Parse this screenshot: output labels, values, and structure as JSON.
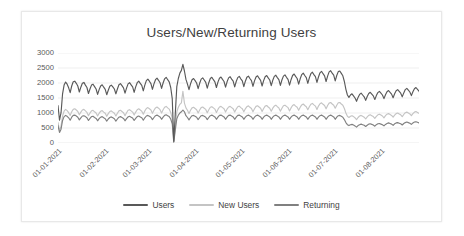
{
  "chart_data": {
    "type": "line",
    "title": "Users/New/Returning Users",
    "xlabel": "",
    "ylabel": "",
    "ylim": [
      0,
      3000
    ],
    "ytick_values": [
      0,
      500,
      1000,
      1500,
      2000,
      2500,
      3000
    ],
    "ytick_labels": [
      "0",
      "500",
      "1000",
      "1500",
      "2000",
      "2500",
      "3000"
    ],
    "grid": true,
    "grid_axis": "y",
    "legend_position": "bottom",
    "x_tick_labels": [
      "01-01-2021",
      "01-02-2021",
      "01-03-2021",
      "01-04-2021",
      "01-05-2021",
      "01-06-2021",
      "01-07-2021",
      "01-08-2021"
    ],
    "x_tick_positions": [
      0,
      31,
      59,
      90,
      120,
      151,
      181,
      212
    ],
    "x_range": [
      0,
      237
    ],
    "colors": {
      "users": "#595959",
      "new_users": "#c4c4c4",
      "returning": "#808080",
      "grid": "#e4e4e4",
      "text": "#595959",
      "title": "#3f3f3f",
      "background": "#ffffff",
      "frame_border": "#e8e8e8"
    },
    "series": [
      {
        "name": "Users",
        "color": "#595959",
        "values": [
          1250,
          760,
          1010,
          1640,
          1930,
          2030,
          1960,
          1840,
          1680,
          1900,
          2040,
          2060,
          1990,
          1900,
          1700,
          1860,
          1990,
          2020,
          1930,
          1850,
          1650,
          1800,
          1930,
          1960,
          1880,
          1800,
          1620,
          1780,
          1900,
          1940,
          1860,
          1790,
          1610,
          1760,
          1890,
          1930,
          1870,
          1800,
          1640,
          1800,
          1940,
          1980,
          1910,
          1840,
          1660,
          1830,
          1970,
          2010,
          1940,
          1870,
          1690,
          1870,
          2010,
          2060,
          1990,
          1920,
          1740,
          1930,
          2080,
          2130,
          2060,
          1980,
          1790,
          1970,
          2110,
          2160,
          2090,
          2010,
          1820,
          2000,
          2140,
          2190,
          2110,
          2040,
          1850,
          1480,
          60,
          980,
          1880,
          2150,
          2330,
          2420,
          2620,
          2400,
          2120,
          1960,
          1780,
          1970,
          2110,
          2150,
          2080,
          2000,
          1810,
          1990,
          2130,
          2170,
          2100,
          2020,
          1830,
          2010,
          2150,
          2190,
          2110,
          2040,
          1850,
          2030,
          2160,
          2200,
          2120,
          2050,
          1860,
          2040,
          2170,
          2210,
          2130,
          2060,
          1870,
          2050,
          2180,
          2220,
          2140,
          2070,
          1880,
          2060,
          2190,
          2230,
          2150,
          2080,
          1890,
          2070,
          2200,
          2240,
          2160,
          2090,
          1900,
          2080,
          2210,
          2250,
          2170,
          2100,
          1910,
          2090,
          2220,
          2260,
          2180,
          2110,
          1920,
          2100,
          2230,
          2270,
          2190,
          2120,
          1930,
          2110,
          2250,
          2300,
          2220,
          2150,
          1960,
          2140,
          2280,
          2330,
          2250,
          2180,
          1990,
          2170,
          2310,
          2360,
          2280,
          2210,
          2020,
          2200,
          2340,
          2390,
          2310,
          2240,
          2050,
          2230,
          2370,
          2410,
          2330,
          2260,
          2070,
          2250,
          2380,
          2400,
          2320,
          2240,
          2050,
          1790,
          1600,
          1520,
          1600,
          1640,
          1570,
          1500,
          1390,
          1520,
          1620,
          1660,
          1600,
          1540,
          1420,
          1550,
          1650,
          1690,
          1630,
          1570,
          1450,
          1580,
          1680,
          1720,
          1660,
          1600,
          1480,
          1610,
          1710,
          1750,
          1690,
          1630,
          1510,
          1640,
          1740,
          1780,
          1720,
          1660,
          1540,
          1670,
          1780,
          1820,
          1760,
          1700,
          1580,
          1710,
          1810,
          1850,
          1790,
          1730,
          1610,
          1740,
          1600,
          1460,
          1380,
          1300,
          980,
          240,
          820,
          1580
        ]
      },
      {
        "name": "New Users",
        "color": "#c4c4c4",
        "values": [
          680,
          420,
          560,
          900,
          1060,
          1120,
          1080,
          1010,
          920,
          1040,
          1120,
          1140,
          1100,
          1050,
          940,
          1030,
          1100,
          1120,
          1070,
          1020,
          910,
          1000,
          1070,
          1090,
          1040,
          1000,
          900,
          990,
          1060,
          1080,
          1030,
          990,
          890,
          980,
          1050,
          1070,
          1030,
          990,
          900,
          990,
          1070,
          1090,
          1050,
          1010,
          910,
          1010,
          1090,
          1110,
          1070,
          1030,
          930,
          1030,
          1110,
          1140,
          1100,
          1060,
          960,
          1070,
          1150,
          1180,
          1140,
          1100,
          990,
          1090,
          1170,
          1200,
          1160,
          1110,
          1000,
          1110,
          1190,
          1220,
          1170,
          1130,
          1020,
          820,
          40,
          560,
          1040,
          1190,
          1290,
          1340,
          1720,
          1330,
          1170,
          1090,
          980,
          1090,
          1170,
          1190,
          1150,
          1110,
          1000,
          1100,
          1180,
          1200,
          1160,
          1120,
          1010,
          1110,
          1190,
          1210,
          1170,
          1130,
          1020,
          1120,
          1200,
          1220,
          1180,
          1140,
          1030,
          1130,
          1200,
          1220,
          1180,
          1140,
          1030,
          1130,
          1210,
          1230,
          1180,
          1140,
          1040,
          1140,
          1210,
          1240,
          1190,
          1150,
          1040,
          1140,
          1220,
          1240,
          1200,
          1160,
          1050,
          1150,
          1230,
          1250,
          1200,
          1160,
          1060,
          1160,
          1230,
          1260,
          1210,
          1170,
          1060,
          1160,
          1240,
          1260,
          1220,
          1180,
          1070,
          1170,
          1250,
          1280,
          1230,
          1190,
          1090,
          1190,
          1270,
          1300,
          1250,
          1210,
          1110,
          1210,
          1290,
          1320,
          1270,
          1230,
          1120,
          1230,
          1310,
          1340,
          1290,
          1250,
          1140,
          1250,
          1330,
          1350,
          1300,
          1260,
          1160,
          1260,
          1340,
          1350,
          1300,
          1260,
          1150,
          1000,
          890,
          850,
          890,
          910,
          880,
          840,
          780,
          850,
          900,
          920,
          890,
          860,
          800,
          870,
          920,
          940,
          910,
          880,
          820,
          890,
          940,
          960,
          930,
          900,
          840,
          910,
          960,
          980,
          950,
          920,
          860,
          930,
          980,
          1000,
          970,
          940,
          880,
          950,
          1010,
          1030,
          1000,
          970,
          910,
          980,
          1030,
          1050,
          1020,
          990,
          930,
          1000,
          920,
          850,
          800,
          760,
          580,
          150,
          490,
          1040
        ]
      },
      {
        "name": "Returning",
        "color": "#808080",
        "values": [
          580,
          350,
          460,
          750,
          880,
          920,
          890,
          840,
          760,
          860,
          920,
          930,
          900,
          860,
          770,
          840,
          900,
          910,
          880,
          840,
          750,
          820,
          880,
          890,
          850,
          820,
          740,
          810,
          860,
          880,
          840,
          810,
          730,
          800,
          850,
          870,
          840,
          810,
          730,
          800,
          860,
          880,
          850,
          820,
          740,
          810,
          870,
          890,
          860,
          830,
          750,
          820,
          880,
          900,
          870,
          840,
          760,
          840,
          900,
          920,
          890,
          860,
          780,
          850,
          910,
          930,
          900,
          870,
          790,
          860,
          920,
          940,
          910,
          880,
          800,
          640,
          30,
          430,
          810,
          930,
          1000,
          1040,
          1100,
          1040,
          910,
          850,
          770,
          850,
          910,
          920,
          890,
          860,
          780,
          850,
          910,
          920,
          890,
          860,
          780,
          850,
          910,
          930,
          900,
          870,
          790,
          860,
          920,
          930,
          900,
          870,
          790,
          860,
          920,
          930,
          900,
          870,
          790,
          860,
          920,
          930,
          900,
          870,
          790,
          860,
          910,
          930,
          900,
          870,
          790,
          860,
          910,
          930,
          900,
          870,
          790,
          860,
          910,
          930,
          900,
          870,
          790,
          860,
          910,
          930,
          900,
          870,
          790,
          860,
          910,
          930,
          900,
          870,
          790,
          860,
          910,
          930,
          900,
          870,
          790,
          860,
          910,
          930,
          900,
          870,
          790,
          860,
          910,
          930,
          900,
          870,
          790,
          860,
          910,
          930,
          900,
          870,
          790,
          860,
          910,
          930,
          900,
          870,
          790,
          860,
          910,
          920,
          890,
          860,
          780,
          680,
          610,
          580,
          610,
          620,
          600,
          570,
          530,
          580,
          610,
          630,
          610,
          590,
          550,
          590,
          630,
          640,
          620,
          600,
          560,
          610,
          640,
          650,
          630,
          610,
          570,
          620,
          650,
          670,
          650,
          630,
          590,
          640,
          670,
          680,
          660,
          640,
          600,
          650,
          680,
          700,
          680,
          660,
          620,
          670,
          700,
          710,
          690,
          670,
          630,
          680,
          630,
          580,
          550,
          520,
          400,
          100,
          340,
          700
        ]
      }
    ]
  },
  "legend": {
    "items": [
      {
        "label": "Users",
        "color": "#595959"
      },
      {
        "label": "New Users",
        "color": "#c4c4c4"
      },
      {
        "label": "Returning",
        "color": "#808080"
      }
    ]
  }
}
